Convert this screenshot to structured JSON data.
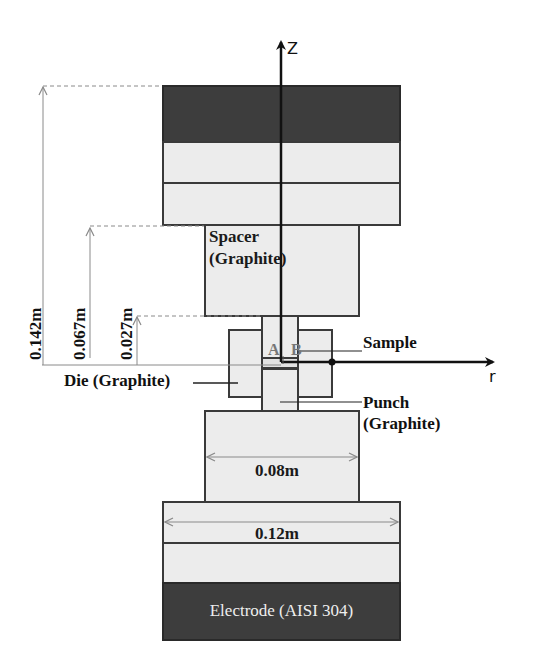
{
  "diagram": {
    "type": "spark plasma sintering setup schematic (axisymmetric)",
    "axes": {
      "z_label": "Z",
      "r_label": "r"
    },
    "components": {
      "spacer_label_line1": "Spacer",
      "spacer_label_line2": "(Graphite)",
      "die_label": "Die (Graphite)",
      "sample_label": "Sample",
      "punch_label_line1": "Punch",
      "punch_label_line2": "(Graphite)",
      "electrode_label": "Electrode (AISI 304)",
      "point_a": "A",
      "point_b": "B"
    },
    "dimensions": {
      "height_total": "0.142m",
      "height_spacer": "0.067m",
      "height_punch": "0.027m",
      "width_spacer": "0.08m",
      "width_base": "0.12m"
    },
    "colors": {
      "electrode_fill": "#3d3d3d",
      "graphite_fill": "#ececec",
      "outline": "#3a3a3a",
      "dimension_line": "#8a8a8a"
    }
  }
}
